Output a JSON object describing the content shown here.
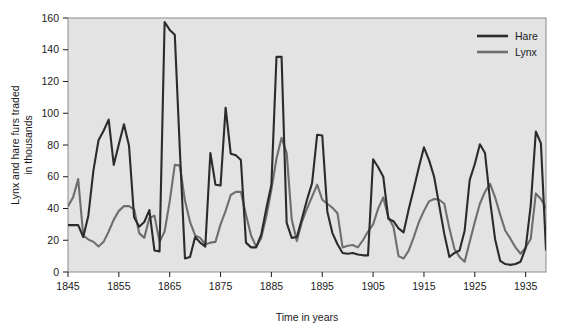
{
  "chart_data": {
    "type": "line",
    "title": "",
    "xlabel": "Time in years",
    "ylabel": "Lynx and hare furs traded in thousands",
    "xlim": [
      1845,
      1939
    ],
    "ylim": [
      0,
      160
    ],
    "xticks": [
      1845,
      1855,
      1865,
      1875,
      1885,
      1895,
      1905,
      1915,
      1925,
      1935
    ],
    "yticks": [
      0,
      20,
      40,
      60,
      80,
      100,
      120,
      140,
      160
    ],
    "grid": false,
    "legend_position": "top-right",
    "plot_background": "#e3e3e3",
    "x": [
      1845,
      1846,
      1847,
      1848,
      1849,
      1850,
      1851,
      1852,
      1853,
      1854,
      1855,
      1856,
      1857,
      1858,
      1859,
      1860,
      1861,
      1862,
      1863,
      1864,
      1865,
      1866,
      1867,
      1868,
      1869,
      1870,
      1871,
      1872,
      1873,
      1874,
      1875,
      1876,
      1877,
      1878,
      1879,
      1880,
      1881,
      1882,
      1883,
      1884,
      1885,
      1886,
      1887,
      1888,
      1889,
      1890,
      1891,
      1892,
      1893,
      1894,
      1895,
      1896,
      1897,
      1898,
      1899,
      1900,
      1901,
      1902,
      1903,
      1904,
      1905,
      1906,
      1907,
      1908,
      1909,
      1910,
      1911,
      1912,
      1913,
      1914,
      1915,
      1916,
      1917,
      1918,
      1919,
      1920,
      1921,
      1922,
      1923,
      1924,
      1925,
      1926,
      1927,
      1928,
      1929,
      1930,
      1931,
      1932,
      1933,
      1934,
      1935,
      1936,
      1937,
      1938,
      1939
    ],
    "series": [
      {
        "name": "Hare",
        "color": "#2b2b2b",
        "values": [
          29.5,
          29.5,
          29.5,
          22.0,
          35.5,
          64.0,
          83.0,
          89.0,
          96.0,
          67.5,
          80.5,
          93.0,
          79.5,
          34.5,
          28.5,
          31.5,
          39.0,
          13.5,
          13.0,
          157.5,
          152.5,
          149.5,
          76.5,
          8.5,
          9.5,
          22.0,
          18.5,
          16.0,
          75.0,
          55.0,
          54.5,
          103.5,
          74.5,
          73.5,
          70.5,
          18.5,
          15.5,
          15.5,
          23.5,
          40.0,
          55.0,
          135.5,
          135.5,
          31.0,
          21.5,
          22.0,
          33.5,
          45.5,
          56.0,
          86.5,
          86.0,
          38.0,
          24.5,
          17.5,
          12.0,
          11.5,
          12.0,
          11.0,
          10.5,
          10.5,
          71.0,
          66.0,
          60.0,
          33.5,
          32.0,
          27.5,
          25.0,
          39.5,
          52.5,
          66.0,
          78.5,
          70.5,
          60.0,
          42.0,
          24.0,
          9.5,
          12.0,
          13.5,
          26.0,
          58.0,
          68.0,
          80.5,
          75.0,
          45.0,
          20.5,
          7.0,
          5.0,
          4.5,
          5.0,
          6.5,
          15.0,
          42.0,
          88.5,
          81.0,
          14.0
        ]
      },
      {
        "name": "Lynx",
        "color": "#6e6e6e",
        "values": [
          41.5,
          47.0,
          58.5,
          23.0,
          20.5,
          19.0,
          16.0,
          19.0,
          25.5,
          33.0,
          38.5,
          41.5,
          41.5,
          39.5,
          24.5,
          21.5,
          34.0,
          35.5,
          19.0,
          25.5,
          44.5,
          67.5,
          67.0,
          45.0,
          31.5,
          23.0,
          21.5,
          17.5,
          18.5,
          19.0,
          30.0,
          38.5,
          48.5,
          50.5,
          50.5,
          36.0,
          23.0,
          16.0,
          21.5,
          35.0,
          52.0,
          71.5,
          84.5,
          75.0,
          33.0,
          19.5,
          31.5,
          40.0,
          47.5,
          55.0,
          45.5,
          43.0,
          40.5,
          37.0,
          15.5,
          16.5,
          17.0,
          15.5,
          20.0,
          25.5,
          30.0,
          40.0,
          47.0,
          34.5,
          28.5,
          10.0,
          8.5,
          13.5,
          22.0,
          31.5,
          38.5,
          44.5,
          46.0,
          45.5,
          43.0,
          27.5,
          14.5,
          9.5,
          6.5,
          19.0,
          31.5,
          43.0,
          50.5,
          55.5,
          47.0,
          36.0,
          26.0,
          21.0,
          15.5,
          11.5,
          15.5,
          21.0,
          49.5,
          46.0,
          40.5
        ]
      }
    ],
    "legend": [
      {
        "label": "Hare",
        "color": "#2b2b2b"
      },
      {
        "label": "Lynx",
        "color": "#6e6e6e"
      }
    ]
  }
}
